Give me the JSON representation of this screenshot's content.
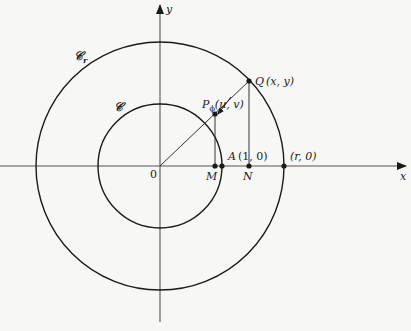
{
  "diagram": {
    "type": "geometry",
    "axes": {
      "x_label": "x",
      "y_label": "y",
      "origin_label": "0"
    },
    "circles": [
      {
        "name": "inner",
        "label": "𝒞",
        "radius_units": 1
      },
      {
        "name": "outer",
        "label": "𝒞",
        "label_sub": "r",
        "radius_units": "r"
      }
    ],
    "points": {
      "P": {
        "label": "P",
        "sub": "ϕ",
        "coords": "(u, v)"
      },
      "Q": {
        "label": "Q",
        "coords": "(x, y)"
      },
      "A": {
        "label": "A",
        "coords": "(1, 0)"
      },
      "R": {
        "label": "",
        "coords": "(r, 0)"
      },
      "M": {
        "label": "M"
      },
      "N": {
        "label": "N"
      }
    },
    "colors": {
      "stroke": "#1a1a1a",
      "background": "#f7f7f5"
    }
  }
}
